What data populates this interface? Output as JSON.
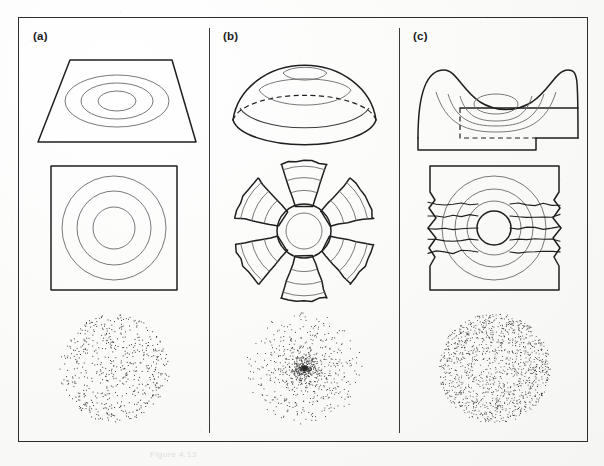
{
  "figure": {
    "caption": "Figure 4.13",
    "border_color": "#2d2d2d",
    "ink_color": "#1f1f1f",
    "contour_color": "#6a6a6a",
    "background_color": "#fbfbfa"
  },
  "panels": [
    {
      "id": "a",
      "label": "(a)",
      "rows": {
        "surface": {
          "name": "flat-plane-surface",
          "description": "flat trapezoidal plane in perspective with three concentric elliptical contours",
          "contour_count": 3
        },
        "map": {
          "name": "undistorted-square-map",
          "description": "square map outline with three concentric circular contours, no tearing",
          "contour_count": 3
        },
        "dots": {
          "name": "uniform-dot-disc",
          "description": "circular disc of evenly spaced dots (uniform density)",
          "dot_count": 520,
          "density": "uniform"
        }
      }
    },
    {
      "id": "b",
      "label": "(b)",
      "rows": {
        "surface": {
          "name": "dome-surface",
          "description": "hemispherical dome with horizontal contour rings and dashed hidden equator",
          "contour_count": 3
        },
        "map": {
          "name": "petal-interrupted-map",
          "description": "flattened dome shown as six petal gores separated by wedge-shaped tears, concentric circular contours",
          "petal_count": 6,
          "contour_count": 4
        },
        "dots": {
          "name": "center-peaked-dot-disc",
          "description": "circular dot cloud strongly concentrated at the centre",
          "dot_count": 900,
          "density": "peaked at centre"
        }
      }
    },
    {
      "id": "c",
      "label": "(c)",
      "rows": {
        "surface": {
          "name": "saddle-surface",
          "description": "saddle / valley surface rising at left and right edges, with nested contours in the trough and a dashed hidden edge",
          "contour_count": 4
        },
        "map": {
          "name": "slit-stretched-map",
          "description": "square map with horizontal slits and ragged torn left and right edges, concentric circular contours",
          "contour_count": 4,
          "slit_count": 5
        },
        "dots": {
          "name": "edge-concentrated-dot-disc",
          "description": "circular dot cloud sparse at centre and dense around the rim",
          "dot_count": 1100,
          "density": "concentrated at rim"
        }
      }
    }
  ]
}
